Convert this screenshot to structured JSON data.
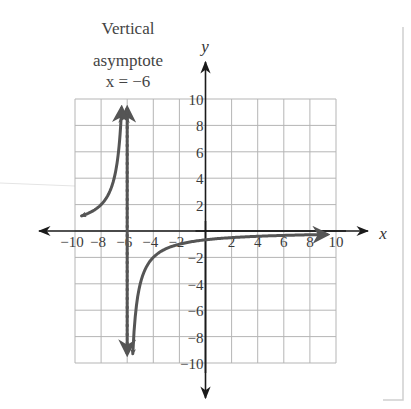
{
  "chart_data": {
    "type": "line",
    "title": "",
    "function": "f(x) = -4/(x+6)",
    "annotation": {
      "lines": [
        "Vertical",
        "asymptote",
        "x = −6"
      ],
      "asymptote_x": -6
    },
    "xlabel": "x",
    "ylabel": "y",
    "xlim": [
      -10,
      10
    ],
    "ylim": [
      -10,
      10
    ],
    "grid": true,
    "grid_step": 2,
    "x_ticks": [
      "−10",
      "−8",
      "−6",
      "−4",
      "−2",
      "2",
      "4",
      "6",
      "8",
      "10"
    ],
    "y_ticks": [
      "10",
      "8",
      "6",
      "4",
      "2",
      "−2",
      "−4",
      "−6",
      "−8",
      "−10"
    ],
    "series": [
      {
        "name": "left branch",
        "x": [
          -9.5,
          -9,
          -8,
          -7.5,
          -7,
          -6.8,
          -6.6,
          -6.43
        ],
        "y": [
          1.14,
          1.33,
          2.0,
          2.67,
          4.0,
          5.0,
          6.67,
          9.3
        ]
      },
      {
        "name": "right branch",
        "x": [
          -5.57,
          -5.4,
          -5.2,
          -5,
          -4,
          -3,
          -2,
          0,
          2,
          4,
          6,
          8,
          9.3
        ],
        "y": [
          -9.3,
          -6.67,
          -5.0,
          -4.0,
          -2.0,
          -1.33,
          -1.0,
          -0.67,
          -0.5,
          -0.4,
          -0.33,
          -0.29,
          -0.26
        ]
      }
    ],
    "colors": {
      "curve": "#555555",
      "asymptote": "#555555",
      "axes": "#1a1a1a",
      "grid": "#b5b5b5"
    }
  }
}
